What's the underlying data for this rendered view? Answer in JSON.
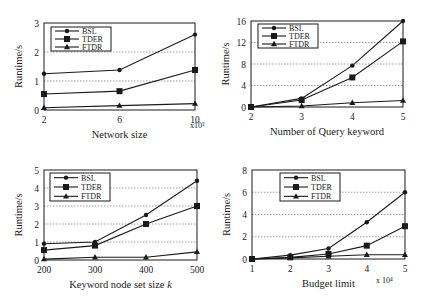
{
  "chart_data": [
    {
      "type": "line",
      "id": "network-size",
      "title": "",
      "xlabel": "Network size",
      "x_multiplier": "x10³",
      "ylabel": "Runtime/s",
      "x": [
        2,
        6,
        10
      ],
      "xticks": [
        "2",
        "6",
        "10"
      ],
      "ylim": [
        0,
        3
      ],
      "yticks": [
        "0",
        "1",
        "2",
        "3"
      ],
      "grid": "horizontal dotted",
      "legend_position": "upper-left",
      "series": [
        {
          "name": "BSL",
          "marker": "diamond",
          "values": [
            1.25,
            1.38,
            2.6
          ]
        },
        {
          "name": "TDER",
          "marker": "square",
          "values": [
            0.55,
            0.65,
            1.38
          ]
        },
        {
          "name": "FTDR",
          "marker": "triangle",
          "values": [
            0.08,
            0.15,
            0.22
          ]
        }
      ]
    },
    {
      "type": "line",
      "id": "query-keyword",
      "title": "",
      "xlabel": "Number of Query keyword",
      "x_multiplier": "",
      "ylabel": "Runtime/s",
      "x": [
        2,
        3,
        4,
        5
      ],
      "xticks": [
        "2",
        "3",
        "4",
        "5"
      ],
      "ylim": [
        0,
        16
      ],
      "yticks": [
        "0",
        "4",
        "8",
        "12",
        "16"
      ],
      "grid": "horizontal dotted",
      "legend_position": "upper-left",
      "series": [
        {
          "name": "BSL",
          "marker": "diamond",
          "values": [
            0,
            1.6,
            7.7,
            16
          ]
        },
        {
          "name": "TDER",
          "marker": "square",
          "values": [
            0,
            1.3,
            5.5,
            12.2
          ]
        },
        {
          "name": "FTDR",
          "marker": "triangle",
          "values": [
            0,
            0.2,
            0.8,
            1.2
          ]
        }
      ]
    },
    {
      "type": "line",
      "id": "keyword-node-set",
      "title": "",
      "xlabel": "Keyword node set size k",
      "x_multiplier": "",
      "ylabel": "Runtime/s",
      "x": [
        200,
        300,
        400,
        500
      ],
      "xticks": [
        "200",
        "300",
        "400",
        "500"
      ],
      "ylim": [
        0,
        5
      ],
      "yticks": [
        "0",
        "1",
        "2",
        "3",
        "4",
        "5"
      ],
      "grid": "horizontal dotted",
      "legend_position": "upper-left",
      "series": [
        {
          "name": "BSL",
          "marker": "diamond",
          "values": [
            0.9,
            1.0,
            2.5,
            4.4
          ]
        },
        {
          "name": "TDER",
          "marker": "square",
          "values": [
            0.55,
            0.8,
            2.0,
            3.0
          ]
        },
        {
          "name": "FTDR",
          "marker": "triangle",
          "values": [
            0.05,
            0.15,
            0.15,
            0.45
          ]
        }
      ]
    },
    {
      "type": "line",
      "id": "budget-limit",
      "title": "",
      "xlabel": "Budget limit",
      "x_multiplier": "x 10⁴",
      "ylabel": "Runtime/s",
      "x": [
        1,
        2,
        3,
        4,
        5
      ],
      "xticks": [
        "1",
        "2",
        "3",
        "4",
        "5"
      ],
      "ylim": [
        0,
        8
      ],
      "yticks": [
        "0",
        "2",
        "4",
        "6",
        "8"
      ],
      "grid": "horizontal dotted",
      "legend_position": "upper-center",
      "series": [
        {
          "name": "BSL",
          "marker": "diamond",
          "values": [
            0,
            0.35,
            0.95,
            3.3,
            6.0
          ]
        },
        {
          "name": "TDER",
          "marker": "square",
          "values": [
            0,
            0.15,
            0.45,
            1.2,
            2.95
          ]
        },
        {
          "name": "FTDR",
          "marker": "triangle",
          "values": [
            0,
            0.1,
            0.25,
            0.38,
            0.38
          ]
        }
      ]
    }
  ],
  "layout": [
    {
      "left": 44,
      "right": 195,
      "top": 23,
      "bottom": 110,
      "legend": {
        "x": 51,
        "y": 27,
        "w": 60,
        "h": 24
      },
      "mult_pos": [
        190,
        128
      ]
    },
    {
      "left": 251,
      "right": 403,
      "top": 21,
      "bottom": 107,
      "legend": {
        "x": 258,
        "y": 24,
        "w": 60,
        "h": 24
      },
      "mult_pos": null
    },
    {
      "left": 44,
      "right": 197,
      "top": 170,
      "bottom": 260,
      "legend": {
        "x": 50,
        "y": 173,
        "w": 60,
        "h": 28
      },
      "mult_pos": null
    },
    {
      "left": 252,
      "right": 405,
      "top": 170,
      "bottom": 259,
      "legend": {
        "x": 280,
        "y": 173,
        "w": 60,
        "h": 28
      },
      "mult_pos": [
        376,
        283
      ]
    }
  ]
}
